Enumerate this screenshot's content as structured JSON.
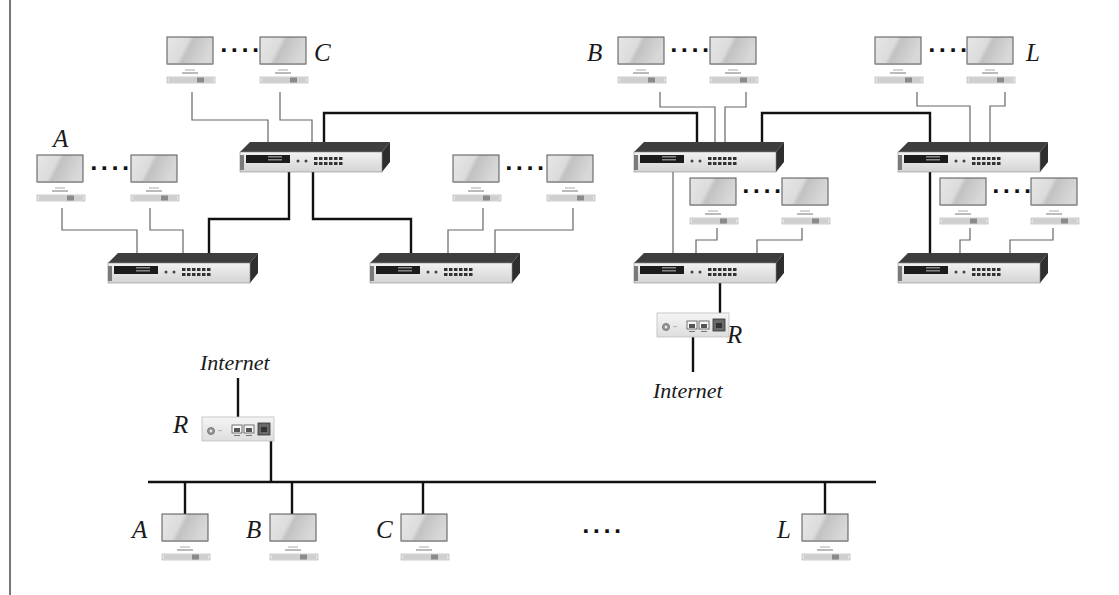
{
  "diagram": {
    "type": "network-topology",
    "upper_panel": {
      "description": "Switched hierarchical LAN with seven switches and one router",
      "labels": {
        "group_A": "A",
        "group_C": "C",
        "group_B": "B",
        "group_L": "L",
        "router": "R",
        "internet": "Internet"
      },
      "ellipsis": "····",
      "switches": [
        {
          "id": "S1",
          "position": "top-left"
        },
        {
          "id": "S2",
          "position": "bottom-left"
        },
        {
          "id": "S3",
          "position": "bottom-middle-left"
        },
        {
          "id": "S4",
          "position": "top-middle-right"
        },
        {
          "id": "S5",
          "position": "bottom-middle-right"
        },
        {
          "id": "S6",
          "position": "top-right"
        },
        {
          "id": "S7",
          "position": "bottom-right"
        }
      ],
      "links": [
        {
          "from": "S1",
          "to": "S2",
          "type": "trunk"
        },
        {
          "from": "S1",
          "to": "S3",
          "type": "trunk"
        },
        {
          "from": "S1",
          "to": "S4",
          "type": "trunk"
        },
        {
          "from": "S4",
          "to": "S5",
          "type": "access"
        },
        {
          "from": "S4",
          "to": "S6",
          "type": "trunk"
        },
        {
          "from": "S6",
          "to": "S7",
          "type": "trunk"
        },
        {
          "from": "S5",
          "to": "R",
          "type": "trunk"
        },
        {
          "from": "R",
          "to": "Internet",
          "type": "trunk"
        }
      ],
      "host_groups": [
        {
          "label": "A",
          "switch": "S2"
        },
        {
          "label": "C",
          "switch": "S1"
        },
        {
          "label": "",
          "switch": "S3"
        },
        {
          "label": "B",
          "switch": "S4"
        },
        {
          "label": "",
          "switch": "S5"
        },
        {
          "label": "L",
          "switch": "S6"
        },
        {
          "label": "",
          "switch": "S7"
        }
      ]
    },
    "lower_panel": {
      "description": "Shared bus LAN with router to Internet",
      "labels": {
        "router": "R",
        "internet": "Internet",
        "host_A": "A",
        "host_B": "B",
        "host_C": "C",
        "host_L": "L"
      },
      "ellipsis": "····",
      "hosts": [
        "A",
        "B",
        "C",
        "L"
      ]
    }
  }
}
